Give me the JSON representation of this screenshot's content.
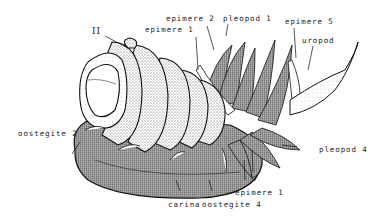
{
  "figure": {
    "labels": {
      "segment_II": "II",
      "epimere_1_top": "epimere 1",
      "epimere_2": "epimere 2",
      "pleopod_1": "pleopod 1",
      "epimere_5": "epimere 5",
      "uropod": "uropod",
      "oostegite_2": "oostegite 2",
      "pleopod_4": "pleopod 4",
      "male_symbol": "♂",
      "epimere_1_bottom": "epimere 1",
      "carina": "carina",
      "oostegite_4": "oostegite 4"
    }
  }
}
